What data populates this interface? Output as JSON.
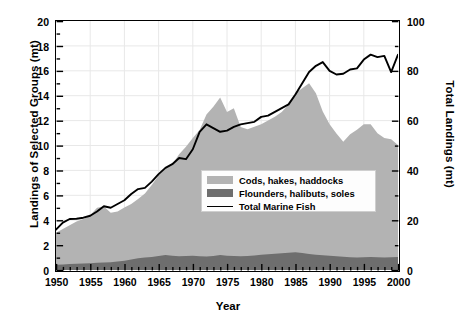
{
  "chart_data": {
    "type": "area",
    "title": "",
    "xlabel": "Year",
    "ylabel": "Landings of Selected Groups (mt)",
    "y2label": "Total Landings (mt)",
    "xlim": [
      1950,
      2000
    ],
    "ylim": [
      0,
      20
    ],
    "y2lim": [
      0,
      100
    ],
    "xticks": [
      1950,
      1955,
      1960,
      1965,
      1970,
      1975,
      1980,
      1985,
      1990,
      1995,
      2000
    ],
    "xtick_labels": [
      "1950",
      "1955",
      "1960",
      "1965",
      "1970",
      "1975",
      "1980",
      "1985",
      "1990",
      "1995",
      "2000"
    ],
    "xminor_step": 1,
    "yticks": [
      0,
      2,
      4,
      6,
      8,
      10,
      12,
      14,
      16,
      18,
      20
    ],
    "ytick_labels": [
      "0",
      "2",
      "4",
      "6",
      "8",
      "10",
      "12",
      "14",
      "16",
      "18",
      "20"
    ],
    "yminor_step": 1,
    "y2ticks": [
      0,
      20,
      40,
      60,
      80,
      100
    ],
    "y2tick_labels": [
      "0",
      "20",
      "40",
      "60",
      "80",
      "100"
    ],
    "y2minor_step": 10,
    "grid": "major-both",
    "legend_position": "center-right-inside",
    "colors": {
      "cods": "#b3b3b3",
      "flounders": "#6e6e6e",
      "line": "#000000",
      "frame": "#000000",
      "grid": "#e8e8e8",
      "background": "#ffffff"
    },
    "x": [
      1950,
      1951,
      1952,
      1953,
      1954,
      1955,
      1956,
      1957,
      1958,
      1959,
      1960,
      1961,
      1962,
      1963,
      1964,
      1965,
      1966,
      1967,
      1968,
      1969,
      1970,
      1971,
      1972,
      1973,
      1974,
      1975,
      1976,
      1977,
      1978,
      1979,
      1980,
      1981,
      1982,
      1983,
      1984,
      1985,
      1986,
      1987,
      1988,
      1989,
      1990,
      1991,
      1992,
      1993,
      1994,
      1995,
      1996,
      1997,
      1998,
      1999,
      2000
    ],
    "series": [
      {
        "name": "Flounders, halibuts, soles",
        "axis": "left",
        "unit": "mt",
        "stack": "bottom",
        "color": "#6e6e6e",
        "values": [
          0.42,
          0.45,
          0.48,
          0.5,
          0.52,
          0.55,
          0.58,
          0.6,
          0.62,
          0.68,
          0.74,
          0.85,
          0.95,
          1.0,
          1.05,
          1.12,
          1.2,
          1.14,
          1.1,
          1.12,
          1.15,
          1.1,
          1.08,
          1.12,
          1.2,
          1.14,
          1.12,
          1.1,
          1.12,
          1.16,
          1.22,
          1.26,
          1.3,
          1.34,
          1.38,
          1.42,
          1.36,
          1.28,
          1.22,
          1.18,
          1.14,
          1.1,
          1.06,
          1.02,
          1.0,
          1.02,
          1.04,
          1.02,
          1.0,
          1.02,
          1.04
        ]
      },
      {
        "name": "Cods, hakes, haddocks",
        "axis": "left",
        "unit": "mt",
        "stack": "top",
        "color": "#b3b3b3",
        "values": [
          2.58,
          2.85,
          3.12,
          3.4,
          3.58,
          3.85,
          4.42,
          4.5,
          3.98,
          4.02,
          4.28,
          4.45,
          4.75,
          5.15,
          5.78,
          6.48,
          7.0,
          7.36,
          8.2,
          8.78,
          9.45,
          10.15,
          11.4,
          12.0,
          12.65,
          11.55,
          11.88,
          10.38,
          10.18,
          10.34,
          10.48,
          10.74,
          11.0,
          11.36,
          11.92,
          12.78,
          13.24,
          13.72,
          12.98,
          11.56,
          10.56,
          9.86,
          9.24,
          9.88,
          10.26,
          10.68,
          10.66,
          9.96,
          9.6,
          9.48,
          9.0
        ]
      },
      {
        "name": "Total Marine Fish",
        "axis": "right",
        "unit": "mt",
        "type": "line",
        "color": "#000000",
        "values": [
          16.2,
          19.0,
          20.5,
          20.6,
          21.0,
          21.8,
          23.5,
          25.6,
          25.0,
          26.5,
          28.0,
          30.5,
          32.5,
          33.0,
          35.5,
          38.5,
          41.0,
          42.5,
          45.0,
          44.5,
          48.5,
          55.5,
          58.5,
          57.0,
          55.5,
          56.0,
          57.5,
          58.5,
          59.0,
          59.5,
          61.5,
          62.0,
          63.5,
          65.0,
          66.5,
          70.5,
          75.0,
          79.5,
          82.0,
          83.5,
          80.0,
          78.5,
          78.8,
          80.5,
          81.0,
          84.5,
          86.5,
          85.5,
          86.0,
          79.5,
          86.5
        ]
      }
    ]
  },
  "legend": {
    "items": [
      {
        "label": "Cods, hakes, haddocks",
        "marker": "swatch-light"
      },
      {
        "label": "Flounders, halibuts, soles",
        "marker": "swatch-dark"
      },
      {
        "label": "Total Marine Fish",
        "marker": "line"
      }
    ]
  }
}
